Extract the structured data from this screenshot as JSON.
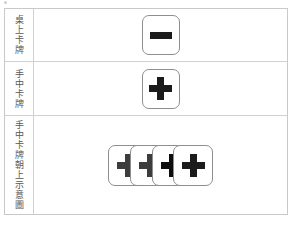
{
  "figure": {
    "title": "",
    "colors": {
      "frame_border": "#c9c9c9",
      "row_divider": "#d0d0d0",
      "card_border": "#8e8e8e",
      "card_face": "#ffffff",
      "glyph_black": "#1b1b1b",
      "glyph_muted": "#3c3c3c",
      "label_text": "#585858",
      "page_background": "#ffffff"
    },
    "rows": [
      {
        "label": "桌上卡牌",
        "cards": [
          {
            "symbol": "minus",
            "glyph": "−",
            "shade": "black",
            "occluded": false
          }
        ]
      },
      {
        "label": "手中卡牌",
        "cards": [
          {
            "symbol": "plus",
            "glyph": "+",
            "shade": "black",
            "occluded": false
          }
        ]
      },
      {
        "label": "手中卡牌朝上示意圖",
        "cards": [
          {
            "symbol": "plus",
            "glyph": "+",
            "shade": "muted",
            "occluded": true
          },
          {
            "symbol": "plus",
            "glyph": "+",
            "shade": "muted",
            "occluded": true
          },
          {
            "symbol": "plus",
            "glyph": "+",
            "shade": "dark",
            "occluded": true
          },
          {
            "symbol": "plus",
            "glyph": "+",
            "shade": "black",
            "occluded": false
          }
        ]
      }
    ]
  }
}
